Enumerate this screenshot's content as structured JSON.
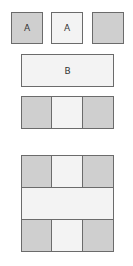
{
  "top_row": [
    {
      "label": "A",
      "shade": "dark"
    },
    {
      "label": "A",
      "shade": "light"
    },
    {
      "label": "",
      "shade": "dark"
    }
  ],
  "bar": {
    "label": "B",
    "shade": "light"
  },
  "three_row": [
    {
      "label": "",
      "shade": "dark"
    },
    {
      "label": "",
      "shade": "light"
    },
    {
      "label": "",
      "shade": "dark"
    }
  ],
  "grid": {
    "top": [
      {
        "shade": "dark"
      },
      {
        "shade": "light"
      },
      {
        "shade": "dark"
      }
    ],
    "middle": {
      "shade": "light",
      "label": ""
    },
    "bottom": [
      {
        "shade": "dark"
      },
      {
        "shade": "light"
      },
      {
        "shade": "dark"
      }
    ]
  },
  "colors": {
    "dark": "#cfcfcf",
    "light": "#f3f3f3",
    "border": "#6b6b6b"
  }
}
